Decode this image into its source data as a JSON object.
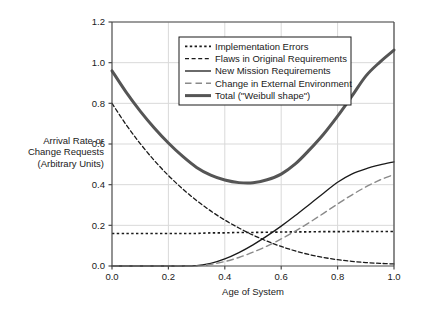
{
  "chart_data": {
    "type": "line",
    "title": "",
    "xlabel": "Age of System",
    "ylabel": "Arrival Rate or Change Requests (Arbitrary Units)",
    "ylabel_lines": [
      "Arrival Rate or",
      "Change Requests",
      "(Arbitrary Units)"
    ],
    "xlim": [
      0.0,
      1.0
    ],
    "ylim": [
      0.0,
      1.2
    ],
    "xticks": [
      "0.0",
      "0.2",
      "0.4",
      "0.6",
      "0.8",
      "1.0"
    ],
    "xtick_values": [
      0.0,
      0.2,
      0.4,
      0.6,
      0.8,
      1.0
    ],
    "yticks": [
      "0.0",
      "0.2",
      "0.4",
      "0.6",
      "0.8",
      "1.0",
      "1.2"
    ],
    "ytick_values": [
      0.0,
      0.2,
      0.4,
      0.6,
      0.8,
      1.0,
      1.2
    ],
    "grid": true,
    "legend_position": "upper center",
    "x": [
      0.0,
      0.05,
      0.1,
      0.15,
      0.2,
      0.25,
      0.3,
      0.35,
      0.4,
      0.45,
      0.5,
      0.55,
      0.6,
      0.65,
      0.7,
      0.75,
      0.8,
      0.85,
      0.9,
      0.95,
      1.0
    ],
    "series": [
      {
        "name": "Implementation Errors",
        "style": "dotted",
        "color": "#1a1a1a",
        "width": 1.6,
        "values": [
          0.16,
          0.16,
          0.16,
          0.16,
          0.16,
          0.16,
          0.16,
          0.163,
          0.163,
          0.165,
          0.165,
          0.166,
          0.167,
          0.168,
          0.168,
          0.169,
          0.169,
          0.17,
          0.17,
          0.17,
          0.17
        ]
      },
      {
        "name": "Flaws in Original Requirements",
        "style": "dashed",
        "color": "#1a1a1a",
        "width": 1.3,
        "values": [
          0.8,
          0.695,
          0.602,
          0.519,
          0.445,
          0.38,
          0.322,
          0.271,
          0.226,
          0.187,
          0.152,
          0.122,
          0.096,
          0.074,
          0.056,
          0.042,
          0.031,
          0.023,
          0.017,
          0.013,
          0.01
        ]
      },
      {
        "name": "New Mission Requirements",
        "style": "solid",
        "color": "#1a1a1a",
        "width": 1.3,
        "values": [
          0.0,
          0.0,
          0.0,
          0.0,
          0.0,
          0.0,
          0.002,
          0.013,
          0.035,
          0.066,
          0.104,
          0.148,
          0.196,
          0.248,
          0.303,
          0.358,
          0.412,
          0.452,
          0.478,
          0.497,
          0.512
        ]
      },
      {
        "name": "Change in External Environment",
        "style": "longdash",
        "color": "#8a8a8a",
        "width": 1.4,
        "values": [
          0.0,
          0.0,
          0.0,
          0.0,
          0.0,
          0.0,
          0.001,
          0.008,
          0.022,
          0.042,
          0.068,
          0.098,
          0.133,
          0.172,
          0.214,
          0.259,
          0.305,
          0.349,
          0.389,
          0.423,
          0.45
        ]
      },
      {
        "name": "Total (\"Weibull shape\")",
        "style": "solid",
        "color": "#555555",
        "width": 3.0,
        "values": [
          0.96,
          0.855,
          0.762,
          0.679,
          0.605,
          0.54,
          0.485,
          0.447,
          0.423,
          0.41,
          0.409,
          0.424,
          0.452,
          0.502,
          0.571,
          0.648,
          0.737,
          0.834,
          0.934,
          1.003,
          1.062
        ]
      }
    ],
    "legend_entries": [
      "Implementation Errors",
      "Flaws in Original Requirements",
      "New Mission Requirements",
      "Change in External Environment",
      "Total (\"Weibull shape\")"
    ]
  },
  "colors": {
    "background": "#ffffff",
    "axis": "#4a4a4a",
    "grid": "#d9d9d9",
    "text": "#1a1a1a",
    "legend_border": "#1a1a1a",
    "total_curve": "#555555",
    "external_curve": "#8a8a8a"
  }
}
